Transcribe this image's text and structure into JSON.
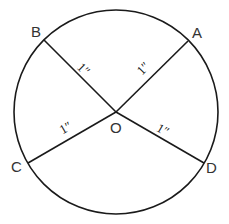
{
  "diagram": {
    "type": "circle-with-radii",
    "colors": {
      "stroke": "#1a1a1a",
      "label": "#333333",
      "background": "#ffffff"
    },
    "circle": {
      "cx": 116,
      "cy": 112,
      "r": 102
    },
    "center": {
      "name": "O",
      "x": 116,
      "y": 112
    },
    "points": [
      {
        "name": "A",
        "x": 188,
        "y": 41
      },
      {
        "name": "B",
        "x": 44,
        "y": 40
      },
      {
        "name": "C",
        "x": 28,
        "y": 163
      },
      {
        "name": "D",
        "x": 204,
        "y": 163
      }
    ],
    "labels": {
      "A": "A",
      "B": "B",
      "C": "C",
      "D": "D",
      "O": "O"
    },
    "segments": [
      {
        "from": "O",
        "to": "A",
        "length_label": "1″"
      },
      {
        "from": "O",
        "to": "B",
        "length_label": "1″"
      },
      {
        "from": "O",
        "to": "C",
        "length_label": "1″"
      },
      {
        "from": "O",
        "to": "D",
        "length_label": "1″"
      }
    ]
  }
}
